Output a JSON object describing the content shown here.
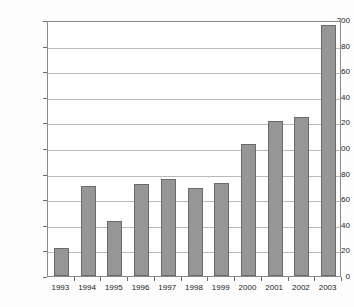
{
  "chart_data": {
    "type": "bar",
    "title": "",
    "xlabel": "",
    "ylabel": "Annual Recoveries (metric tonnes yr-1)",
    "ylabel_main": "Annual Recoveries (metric tonnes yr",
    "ylabel_sup": "-1",
    "ylabel_tail": ")",
    "categories": [
      "1993",
      "1994",
      "1995",
      "1996",
      "1997",
      "1998",
      "1999",
      "2000",
      "2001",
      "2002",
      "2003"
    ],
    "values": [
      22,
      70,
      43,
      72,
      76,
      69,
      73,
      103,
      121,
      124,
      196
    ],
    "ylim": [
      0,
      200
    ],
    "ytick_values": [
      0,
      20,
      40,
      60,
      80,
      100,
      120,
      140,
      160,
      180,
      200
    ],
    "ytick_labels": [
      "0",
      "20",
      "40",
      "60",
      "80",
      "100",
      "120",
      "140",
      "160",
      "180",
      "200"
    ],
    "grid": true,
    "legend": false,
    "bar_color": "#969696",
    "bar_edge_color": "#6a6a6a",
    "grid_color": "#b9b9b9",
    "axis_color": "#8a8a8a",
    "background": "#ffffff"
  }
}
